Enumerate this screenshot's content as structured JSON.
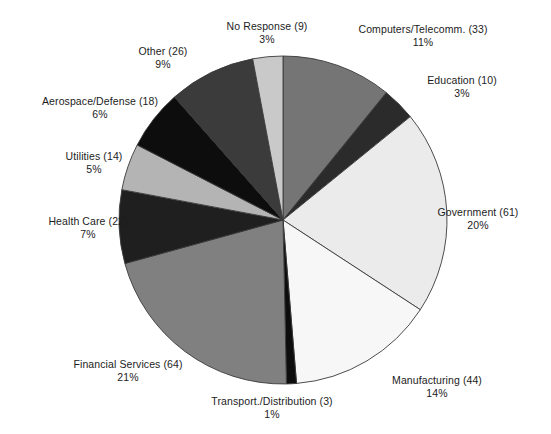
{
  "chart_data": {
    "type": "pie",
    "title": "",
    "subtitle": "",
    "xlabel": "",
    "ylabel": "",
    "legend_position": "none",
    "grid": false,
    "total_responses": 304,
    "value_unit": "responses",
    "labels": [
      "Computers/Telecomm. (33)",
      "Education (10)",
      "Government (61)",
      "Manufacturing (44)",
      "Transport./Distribution (3)",
      "Financial Services (64)",
      "Health Care (22)",
      "Utilities (14)",
      "Aerospace/Defense (18)",
      "Other (26)",
      "No Response (9)"
    ],
    "categories": [
      "Computers/Telecomm.",
      "Education",
      "Government",
      "Manufacturing",
      "Transport./Distribution",
      "Financial Services",
      "Health Care",
      "Utilities",
      "Aerospace/Defense",
      "Other",
      "No Response"
    ],
    "values": [
      33,
      10,
      61,
      44,
      3,
      64,
      22,
      14,
      18,
      26,
      9
    ],
    "percent_labels": [
      "11%",
      "3%",
      "20%",
      "14%",
      "1%",
      "21%",
      "7%",
      "5%",
      "6%",
      "9%",
      "3%"
    ],
    "percents": [
      11,
      3,
      20,
      14,
      1,
      21,
      7,
      5,
      6,
      9,
      3
    ],
    "colors": [
      "#757575",
      "#2b2b2b",
      "#ebebeb",
      "#f7f7f7",
      "#0d0d0d",
      "#808080",
      "#1f1f1f",
      "#b4b4b4",
      "#0d0d0d",
      "#3b3b3b",
      "#c9c9c9"
    ],
    "slice_outline_color": "#3a3a3a",
    "start_angle_deg": 0,
    "direction": "clockwise",
    "slices": [
      {
        "label": "Computers/Telecomm. (33)",
        "name": "Computers/Telecomm.",
        "value": 33,
        "percent_label": "11%",
        "percent": 11,
        "color": "#757575"
      },
      {
        "label": "Education (10)",
        "name": "Education",
        "value": 10,
        "percent_label": "3%",
        "percent": 3,
        "color": "#2b2b2b"
      },
      {
        "label": "Government (61)",
        "name": "Government",
        "value": 61,
        "percent_label": "20%",
        "percent": 20,
        "color": "#ebebeb"
      },
      {
        "label": "Manufacturing (44)",
        "name": "Manufacturing",
        "value": 44,
        "percent_label": "14%",
        "percent": 14,
        "color": "#f7f7f7"
      },
      {
        "label": "Transport./Distribution (3)",
        "name": "Transport./Distribution",
        "value": 3,
        "percent_label": "1%",
        "percent": 1,
        "color": "#0d0d0d"
      },
      {
        "label": "Financial Services (64)",
        "name": "Financial Services",
        "value": 64,
        "percent_label": "21%",
        "percent": 21,
        "color": "#808080"
      },
      {
        "label": "Health Care (22)",
        "name": "Health Care",
        "value": 22,
        "percent_label": "7%",
        "percent": 7,
        "color": "#1f1f1f"
      },
      {
        "label": "Utilities (14)",
        "name": "Utilities",
        "value": 14,
        "percent_label": "5%",
        "percent": 5,
        "color": "#b4b4b4"
      },
      {
        "label": "Aerospace/Defense (18)",
        "name": "Aerospace/Defense",
        "value": 18,
        "percent_label": "6%",
        "percent": 6,
        "color": "#0d0d0d"
      },
      {
        "label": "Other (26)",
        "name": "Other",
        "value": 26,
        "percent_label": "9%",
        "percent": 9,
        "color": "#3b3b3b"
      },
      {
        "label": "No Response (9)",
        "name": "No Response",
        "value": 9,
        "percent_label": "3%",
        "percent": 3,
        "color": "#c9c9c9"
      }
    ]
  },
  "geometry": {
    "center_x": 283,
    "center_y": 220,
    "radius": 164,
    "label_positions": [
      {
        "x": 423,
        "y": 23,
        "anchor": "center"
      },
      {
        "x": 462,
        "y": 74,
        "anchor": "center"
      },
      {
        "x": 478,
        "y": 206,
        "anchor": "center"
      },
      {
        "x": 437,
        "y": 374,
        "anchor": "center"
      },
      {
        "x": 272,
        "y": 395,
        "anchor": "center"
      },
      {
        "x": 128,
        "y": 358,
        "anchor": "center"
      },
      {
        "x": 88,
        "y": 215,
        "anchor": "center"
      },
      {
        "x": 94,
        "y": 150,
        "anchor": "center"
      },
      {
        "x": 100,
        "y": 95,
        "anchor": "center"
      },
      {
        "x": 163,
        "y": 45,
        "anchor": "center"
      },
      {
        "x": 267,
        "y": 20,
        "anchor": "center"
      }
    ]
  }
}
